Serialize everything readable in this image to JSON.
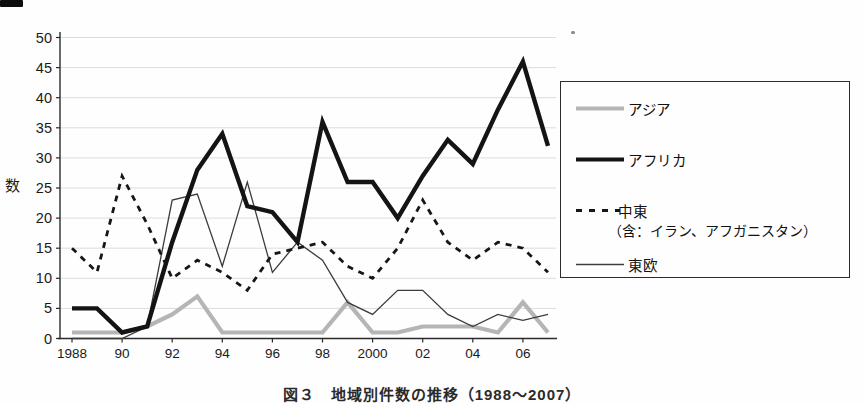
{
  "page": {
    "background": "#fefefe",
    "artifacts": [
      "top-left scan mark",
      "small speck upper right"
    ]
  },
  "chart_data": {
    "type": "line",
    "caption": "図３　地域別件数の推移（1988～2007）",
    "ylabel": "数",
    "ylim": [
      0,
      50
    ],
    "ytick_step": 5,
    "ytick_labels": [
      "0",
      "5",
      "10",
      "15",
      "20",
      "25",
      "30",
      "35",
      "40",
      "45",
      "50"
    ],
    "grid": "horizontal gridlines every 5, light gray",
    "grid_color": "#dcdcdc",
    "axis_color": "#2b2b2b",
    "tick_label_color": "#1a1a1a",
    "legend_position": "right",
    "x": [
      1988,
      1989,
      1990,
      1991,
      1992,
      1993,
      1994,
      1995,
      1996,
      1997,
      1998,
      1999,
      2000,
      2001,
      2002,
      2003,
      2004,
      2005,
      2006,
      2007
    ],
    "xticks": [
      {
        "label": "1988",
        "year": 1988
      },
      {
        "label": "90",
        "year": 1990
      },
      {
        "label": "92",
        "year": 1992
      },
      {
        "label": "94",
        "year": 1994
      },
      {
        "label": "96",
        "year": 1996
      },
      {
        "label": "98",
        "year": 1998
      },
      {
        "label": "2000",
        "year": 2000
      },
      {
        "label": "02",
        "year": 2002
      },
      {
        "label": "04",
        "year": 2004
      },
      {
        "label": "06",
        "year": 2006
      }
    ],
    "series": [
      {
        "name": "アジア",
        "style": "solid",
        "color": "#b5b5b5",
        "width": 4.2,
        "values": [
          1,
          1,
          1,
          2,
          4,
          7,
          1,
          1,
          1,
          1,
          1,
          6,
          1,
          1,
          2,
          2,
          2,
          1,
          6,
          1
        ]
      },
      {
        "name": "東欧",
        "style": "solid",
        "color": "#3c3c3c",
        "width": 1.3,
        "values": [
          0,
          0,
          0,
          2,
          23,
          24,
          12,
          26,
          11,
          16,
          13,
          6,
          4,
          8,
          8,
          4,
          2,
          4,
          3,
          4
        ]
      },
      {
        "name": "中東（含：イラン、アフガニスタン）",
        "style": "dashed",
        "color": "#161616",
        "width": 2.8,
        "dash": "6 6",
        "values": [
          15,
          11,
          27,
          19,
          10,
          13,
          11,
          8,
          14,
          15,
          16,
          12,
          10,
          15,
          23,
          16,
          13,
          16,
          15,
          11
        ]
      },
      {
        "name": "アフリカ",
        "style": "solid",
        "color": "#141414",
        "width": 4.4,
        "values": [
          5,
          5,
          1,
          2,
          16,
          28,
          34,
          22,
          21,
          16,
          36,
          26,
          26,
          20,
          27,
          33,
          29,
          38,
          46,
          32
        ]
      }
    ]
  },
  "legend": {
    "items": [
      {
        "label": "アジア",
        "series": "アジア"
      },
      {
        "label": "アフリカ",
        "series": "アフリカ"
      },
      {
        "label": "中東",
        "sublabel": "（含：イラン、アフガニスタン）",
        "series": "中東（含：イラン、アフガニスタン）"
      },
      {
        "label": "東欧",
        "series": "東欧"
      }
    ]
  }
}
